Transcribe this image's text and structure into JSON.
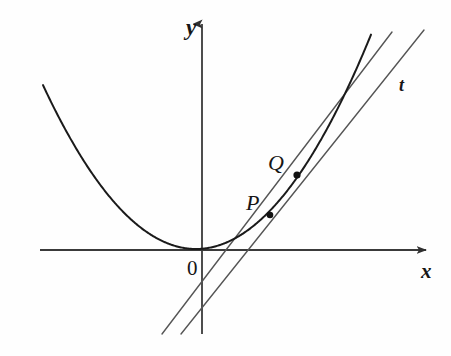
{
  "figure": {
    "background_color": "#fefefe",
    "ink_color": "#161616",
    "curve_color": "#1a1a1a",
    "line_color": "#555555",
    "axis_color": "#3a3a3a"
  },
  "labels": {
    "y_axis": "y",
    "x_axis": "x",
    "tangent": "t",
    "point_p": "P",
    "point_q": "Q",
    "origin": "0"
  },
  "chart_data": {
    "type": "line",
    "title": "",
    "xlabel": "x",
    "ylabel": "y",
    "grid": false,
    "legend": null,
    "origin_px": [
      200,
      250
    ],
    "axes": {
      "x_axis": {
        "from_px": [
          40,
          250
        ],
        "to_px": [
          432,
          250
        ],
        "arrow": "right"
      },
      "y_axis": {
        "from_px": [
          202,
          334
        ],
        "to_px": [
          202,
          18
        ],
        "arrow": "up"
      }
    },
    "series": [
      {
        "name": "parabola",
        "kind": "curve",
        "equation": "y = a(x - h)^2 + k",
        "vertex_px": [
          196,
          249
        ],
        "coefficient_px": 0.007,
        "x_range_px": [
          43,
          371
        ],
        "color": "#1a1a1a",
        "width": 2.0
      },
      {
        "name": "secant-PQ",
        "kind": "line",
        "through_points": [
          "P",
          "Q"
        ],
        "from_px": [
          162,
          334
        ],
        "to_px": [
          392,
          32
        ],
        "x_axis_crossing_px": 237,
        "color": "#555555",
        "width": 1.4
      },
      {
        "name": "tangent-t",
        "kind": "line",
        "tangent_at": "P",
        "from_px": [
          181,
          334
        ],
        "to_px": [
          424,
          30
        ],
        "x_axis_crossing_px": 247,
        "color": "#555555",
        "width": 1.4
      }
    ],
    "points": [
      {
        "name": "P",
        "px": [
          270,
          215
        ],
        "label": "P",
        "label_px": [
          246,
          192
        ],
        "radius_px": 3.3
      },
      {
        "name": "Q",
        "px": [
          297,
          175
        ],
        "label": "Q",
        "label_px": [
          268,
          152
        ],
        "radius_px": 3.6
      }
    ],
    "annotations": [
      {
        "text": "t",
        "px": [
          403,
          88
        ]
      },
      {
        "text": "0",
        "px": [
          193,
          272
        ]
      },
      {
        "text": "y",
        "px": [
          192,
          28
        ]
      },
      {
        "text": "x",
        "px": [
          426,
          272
        ]
      }
    ]
  }
}
